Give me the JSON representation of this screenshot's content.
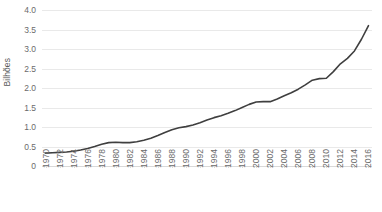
{
  "chart_data": {
    "type": "line",
    "title": "",
    "xlabel": "",
    "ylabel": "Bilhões",
    "ylim": [
      0,
      4.0
    ],
    "yticks": [
      "0",
      "0.5",
      "1.0",
      "1.5",
      "2.0",
      "2.5",
      "3.0",
      "3.5",
      "4.0"
    ],
    "ytick_values": [
      0,
      0.5,
      1.0,
      1.5,
      2.0,
      2.5,
      3.0,
      3.5,
      4.0
    ],
    "xlim": [
      1970,
      2016
    ],
    "xtick_labels": [
      "1970",
      "1972",
      "1974",
      "1976",
      "1978",
      "1980",
      "1982",
      "1984",
      "1986",
      "1988",
      "1990",
      "1992",
      "1994",
      "1996",
      "1998",
      "2000",
      "2002",
      "2004",
      "2006",
      "2008",
      "2010",
      "2012",
      "2014",
      "2016"
    ],
    "grid": true,
    "legend": "none",
    "line_color": "#3f3f3f",
    "grid_color": "#e9e9e9",
    "tick_text_color": "#6b6b6b",
    "axis_title_color": "#595959",
    "x": [
      1970,
      1971,
      1972,
      1973,
      1974,
      1975,
      1976,
      1977,
      1978,
      1979,
      1980,
      1981,
      1982,
      1983,
      1984,
      1985,
      1986,
      1987,
      1988,
      1989,
      1990,
      1991,
      1992,
      1993,
      1994,
      1995,
      1996,
      1997,
      1998,
      1999,
      2000,
      2001,
      2002,
      2003,
      2004,
      2005,
      2006,
      2007,
      2008,
      2009,
      2010,
      2011,
      2012,
      2013,
      2014,
      2015,
      2016
    ],
    "values": [
      0.33,
      0.34,
      0.35,
      0.36,
      0.38,
      0.41,
      0.45,
      0.5,
      0.56,
      0.6,
      0.61,
      0.6,
      0.6,
      0.62,
      0.66,
      0.71,
      0.78,
      0.86,
      0.93,
      0.98,
      1.01,
      1.05,
      1.11,
      1.18,
      1.24,
      1.29,
      1.35,
      1.42,
      1.5,
      1.58,
      1.64,
      1.65,
      1.65,
      1.72,
      1.8,
      1.88,
      1.97,
      2.08,
      2.2,
      2.24,
      2.25,
      2.42,
      2.62,
      2.76,
      2.95,
      3.25,
      3.6
    ]
  }
}
